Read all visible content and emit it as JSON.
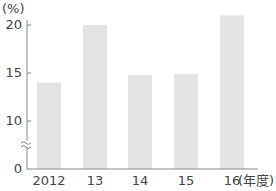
{
  "chart_data": {
    "type": "bar",
    "title": "",
    "xlabel": "(年度)",
    "ylabel": "(%)",
    "categories": [
      "2012",
      "13",
      "14",
      "15",
      "16"
    ],
    "values": [
      14.0,
      20.0,
      14.8,
      14.9,
      21.0
    ],
    "ylim": [
      0,
      22
    ],
    "yticks": [
      0,
      10,
      15,
      20
    ],
    "axis_break": "between 0 and 10",
    "grid": false,
    "legend": null,
    "bar_color": "#e3e3e3"
  },
  "labels": {
    "unit": "(%)",
    "x_unit": "(年度)",
    "y_ticks": [
      "20",
      "15",
      "10",
      "0"
    ]
  }
}
